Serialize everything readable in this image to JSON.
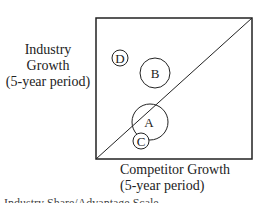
{
  "diagram": {
    "type": "growth-share-matrix",
    "y_axis_label": [
      "Industry",
      "Growth",
      "(5-year period)"
    ],
    "x_axis_label": [
      "Competitor Growth",
      "(5-year period)"
    ],
    "bottom_cutoff_text": "Industry Share/Advantage Scale",
    "box": {
      "x1": 96,
      "y1": 18,
      "x2": 252,
      "y2": 159
    },
    "diagonal": {
      "from": "bottom-left",
      "to": "top-right"
    },
    "circles": [
      {
        "label": "D",
        "cx": 120,
        "cy": 58,
        "r": 8
      },
      {
        "label": "B",
        "cx": 155,
        "cy": 73,
        "r": 15
      },
      {
        "label": "A",
        "cx": 150,
        "cy": 122,
        "r": 18
      },
      {
        "label": "C",
        "cx": 141,
        "cy": 141,
        "r": 8
      }
    ],
    "stroke_color": "#222222",
    "background": "#ffffff"
  }
}
